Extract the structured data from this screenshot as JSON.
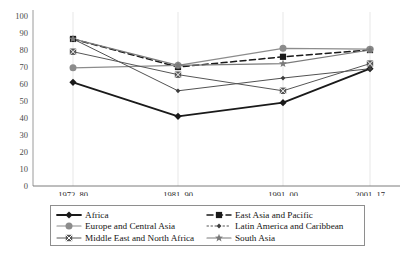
{
  "chart_data": {
    "type": "line",
    "title": "",
    "subtitle": "",
    "xlabel": "",
    "ylabel": "",
    "categories": [
      "1972–80",
      "1981–90",
      "1991–00",
      "2001–17"
    ],
    "ylim": [
      0,
      100
    ],
    "yticks": [
      0,
      10,
      20,
      30,
      40,
      50,
      60,
      70,
      80,
      90,
      100
    ],
    "grid": "vertical-light",
    "legend_position": "bottom",
    "series": [
      {
        "name": "Africa",
        "values": [
          61,
          41,
          49,
          69
        ],
        "color": "#1a1a1a",
        "marker": "diamond",
        "dash": "solid",
        "width": 1.8
      },
      {
        "name": "East Asia and Pacific",
        "values": [
          86.5,
          70,
          76,
          80
        ],
        "color": "#1a1a1a",
        "marker": "square",
        "dash": "dashed",
        "width": 1.5
      },
      {
        "name": "Europe and Central Asia",
        "values": [
          69.5,
          71,
          81,
          80.5
        ],
        "color": "#8c8c8c",
        "marker": "circle",
        "dash": "solid",
        "width": 1.2
      },
      {
        "name": "Latin America and Caribbean",
        "values": [
          86.5,
          56,
          63.5,
          69
        ],
        "color": "#3d3d3d",
        "marker": "small-diamond",
        "dash": "solid",
        "width": 0.9
      },
      {
        "name": "Middle East and North Africa",
        "values": [
          79,
          65.5,
          56,
          72
        ],
        "color": "#565656",
        "marker": "x-box",
        "dash": "solid",
        "width": 1.0
      },
      {
        "name": "South Asia",
        "values": [
          86.5,
          71,
          72,
          80
        ],
        "color": "#7a7a7a",
        "marker": "star",
        "dash": "solid",
        "width": 1.2
      }
    ]
  },
  "legend": {
    "items": [
      {
        "label": "Africa",
        "marker": "diamond",
        "color": "#1a1a1a",
        "dash": "solid",
        "width": 1.8
      },
      {
        "label": "East Asia and Pacific",
        "marker": "square",
        "color": "#1a1a1a",
        "dash": "dashed",
        "width": 1.5
      },
      {
        "label": "Europe and Central Asia",
        "marker": "circle",
        "color": "#8c8c8c",
        "dash": "solid",
        "width": 1.2
      },
      {
        "label": "Latin America and Caribbean",
        "marker": "small-diamond",
        "color": "#3d3d3d",
        "dash": "dotted",
        "width": 0.9
      },
      {
        "label": "Middle East and North Africa",
        "marker": "x-box",
        "color": "#565656",
        "dash": "solid",
        "width": 1.0
      },
      {
        "label": "South Asia",
        "marker": "star",
        "color": "#7a7a7a",
        "dash": "solid",
        "width": 1.2
      }
    ]
  },
  "axis": {
    "y_line_color": "#9a9a9a",
    "x_line_color": "#6e6e6e",
    "gridline_color": "#dcdcdc"
  },
  "bottom_caption": ""
}
